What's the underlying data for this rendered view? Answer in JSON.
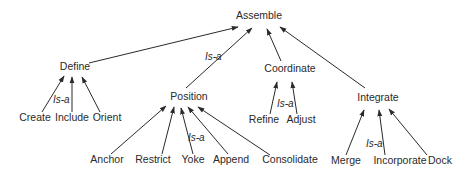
{
  "diagram": {
    "type": "hierarchy",
    "relation_label": "Is-a",
    "root": {
      "id": "assemble",
      "label": "Assemble",
      "x": 259,
      "y": 19
    },
    "nodes": [
      {
        "id": "define",
        "label": "Define",
        "x": 75,
        "y": 70,
        "parent": "assemble"
      },
      {
        "id": "position",
        "label": "Position",
        "x": 189,
        "y": 100,
        "parent": "assemble"
      },
      {
        "id": "coordinate",
        "label": "Coordinate",
        "x": 290,
        "y": 72,
        "parent": "assemble"
      },
      {
        "id": "integrate",
        "label": "Integrate",
        "x": 378,
        "y": 101,
        "parent": "assemble"
      },
      {
        "id": "create",
        "label": "Create",
        "x": 35,
        "y": 121,
        "parent": "define"
      },
      {
        "id": "include",
        "label": "Include",
        "x": 72,
        "y": 121,
        "parent": "define"
      },
      {
        "id": "orient",
        "label": "Orient",
        "x": 107,
        "y": 121,
        "parent": "define"
      },
      {
        "id": "anchor",
        "label": "Anchor",
        "x": 107,
        "y": 163,
        "parent": "position"
      },
      {
        "id": "restrict",
        "label": "Restrict",
        "x": 153,
        "y": 163,
        "parent": "position"
      },
      {
        "id": "yoke",
        "label": "Yoke",
        "x": 193,
        "y": 163,
        "parent": "position"
      },
      {
        "id": "append",
        "label": "Append",
        "x": 231,
        "y": 163,
        "parent": "position"
      },
      {
        "id": "consolidate",
        "label": "Consolidate",
        "x": 290,
        "y": 163,
        "parent": "position"
      },
      {
        "id": "refine",
        "label": "Refine",
        "x": 264,
        "y": 123,
        "parent": "coordinate"
      },
      {
        "id": "adjust",
        "label": "Adjust",
        "x": 301,
        "y": 123,
        "parent": "coordinate"
      },
      {
        "id": "merge",
        "label": "Merge",
        "x": 346,
        "y": 164,
        "parent": "integrate"
      },
      {
        "id": "incorporate",
        "label": "Incorporate",
        "x": 400,
        "y": 164,
        "parent": "integrate"
      },
      {
        "id": "dock",
        "label": "Dock",
        "x": 440,
        "y": 164,
        "parent": "integrate"
      }
    ],
    "edges": [
      {
        "from": "define",
        "to": "assemble",
        "x1": 89,
        "y1": 63,
        "x2": 238,
        "y2": 27
      },
      {
        "from": "position",
        "to": "assemble",
        "x1": 186,
        "y1": 88,
        "x2": 252,
        "y2": 28
      },
      {
        "from": "coordinate",
        "to": "assemble",
        "x1": 281,
        "y1": 61,
        "x2": 267,
        "y2": 29
      },
      {
        "from": "integrate",
        "to": "assemble",
        "x1": 365,
        "y1": 88,
        "x2": 280,
        "y2": 27
      },
      {
        "from": "create",
        "to": "define",
        "x1": 42,
        "y1": 112,
        "x2": 64,
        "y2": 76
      },
      {
        "from": "include",
        "to": "define",
        "x1": 72,
        "y1": 112,
        "x2": 72,
        "y2": 77
      },
      {
        "from": "orient",
        "to": "define",
        "x1": 100,
        "y1": 112,
        "x2": 82,
        "y2": 77
      },
      {
        "from": "anchor",
        "to": "position",
        "x1": 111,
        "y1": 154,
        "x2": 166,
        "y2": 106
      },
      {
        "from": "restrict",
        "to": "position",
        "x1": 162,
        "y1": 154,
        "x2": 174,
        "y2": 107
      },
      {
        "from": "yoke",
        "to": "position",
        "x1": 193,
        "y1": 154,
        "x2": 181,
        "y2": 108
      },
      {
        "from": "append",
        "to": "position",
        "x1": 228,
        "y1": 154,
        "x2": 188,
        "y2": 107
      },
      {
        "from": "consolidate",
        "to": "position",
        "x1": 270,
        "y1": 155,
        "x2": 198,
        "y2": 107
      },
      {
        "from": "refine",
        "to": "coordinate",
        "x1": 270,
        "y1": 114,
        "x2": 277,
        "y2": 82
      },
      {
        "from": "adjust",
        "to": "coordinate",
        "x1": 297,
        "y1": 114,
        "x2": 292,
        "y2": 82
      },
      {
        "from": "merge",
        "to": "integrate",
        "x1": 346,
        "y1": 155,
        "x2": 364,
        "y2": 110
      },
      {
        "from": "incorporate",
        "to": "integrate",
        "x1": 385,
        "y1": 155,
        "x2": 379,
        "y2": 110
      },
      {
        "from": "dock",
        "to": "integrate",
        "x1": 427,
        "y1": 155,
        "x2": 389,
        "y2": 109
      }
    ],
    "isa_labels": [
      {
        "text": "Is-a",
        "x": 205,
        "y": 60
      },
      {
        "text": "Is-a",
        "x": 53,
        "y": 103
      },
      {
        "text": "Is-a",
        "x": 188,
        "y": 141
      },
      {
        "text": "Is-a",
        "x": 277,
        "y": 107
      },
      {
        "text": "Is-a",
        "x": 366,
        "y": 147
      }
    ]
  }
}
